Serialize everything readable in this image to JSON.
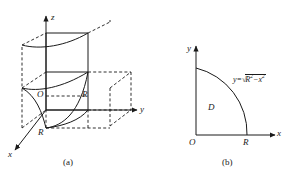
{
  "figure": {
    "background_color": "#ffffff",
    "stroke_color": "#1a1a1a",
    "panels": [
      {
        "id": "a",
        "caption": "(a)",
        "type": "3d-coordinate-diagram",
        "axes": [
          {
            "name": "z",
            "label": "z",
            "direction": "up"
          },
          {
            "name": "y",
            "label": "y",
            "direction": "right"
          },
          {
            "name": "x",
            "label": "x",
            "direction": "lower-left"
          }
        ],
        "point_labels": [
          {
            "name": "origin",
            "label": "O"
          },
          {
            "name": "radius-on-y",
            "label": "R"
          },
          {
            "name": "radius-on-x",
            "label": "R"
          }
        ]
      },
      {
        "id": "b",
        "caption": "(b)",
        "type": "2d-region-diagram",
        "axes": [
          {
            "name": "y",
            "label": "y",
            "direction": "up"
          },
          {
            "name": "x",
            "label": "x",
            "direction": "right"
          }
        ],
        "region_label": "D",
        "point_labels": [
          {
            "name": "origin",
            "label": "O"
          },
          {
            "name": "radius-on-x",
            "label": "R"
          }
        ],
        "curve_equation": {
          "lhs": "y=",
          "radicand_base": "R",
          "radicand_exp": "2",
          "minus": "−",
          "subtrahend_base": "x",
          "subtrahend_exp": "2"
        }
      }
    ]
  }
}
